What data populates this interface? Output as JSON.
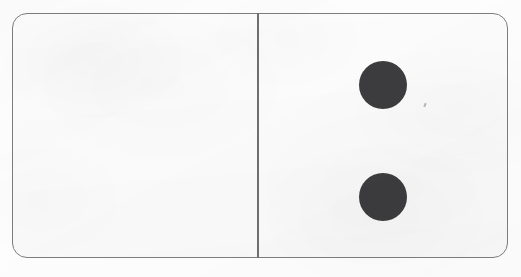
{
  "scene": {
    "kind": "domino-tile",
    "background_color": "#fdfdfd",
    "width": 521,
    "height": 277,
    "caption": ""
  },
  "tile": {
    "label": "Domino 0-2",
    "face_color": "#fcfcfc",
    "border_color": "#7d7d80",
    "divider_color": "#6f6f72",
    "pip_color": "#3c3c3e",
    "total_pips": 2,
    "orientation": "horizontal",
    "halves": [
      {
        "id": "left",
        "name": "left-half",
        "value": 0,
        "value_label": "0",
        "pip_positions": []
      },
      {
        "id": "right",
        "name": "right-half",
        "value": 2,
        "value_label": "2",
        "pip_positions": [
          "top",
          "bottom"
        ]
      }
    ]
  },
  "artifacts": {
    "scan_speck_color": "#b9b9bb"
  }
}
